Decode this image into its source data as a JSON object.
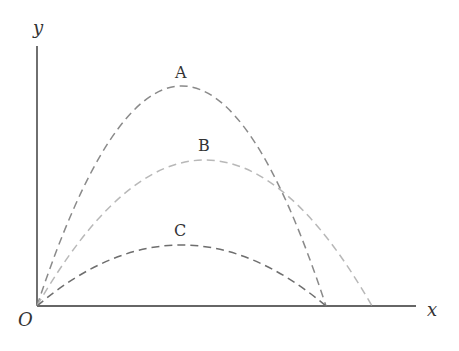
{
  "axes": {
    "x_label": "x",
    "y_label": "y",
    "origin_label": "O"
  },
  "curves": [
    {
      "label": "A",
      "color": "#8a8a8a",
      "peak_height": "highest",
      "range": "short"
    },
    {
      "label": "B",
      "color": "#b5b5b5",
      "peak_height": "middle",
      "range": "longest"
    },
    {
      "label": "C",
      "color": "#6e6e6e",
      "peak_height": "lowest",
      "range": "short"
    }
  ],
  "caption": ""
}
